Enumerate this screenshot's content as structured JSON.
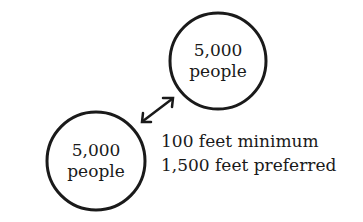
{
  "nodes": [
    {
      "id": "node-upper",
      "value": "5,000",
      "unit": "people"
    },
    {
      "id": "node-lower",
      "value": "5,000",
      "unit": "people"
    }
  ],
  "connector": {
    "type": "double-headed-arrow"
  },
  "distance_note": {
    "line1": "100 feet minimum",
    "line2": "1,500 feet preferred"
  }
}
